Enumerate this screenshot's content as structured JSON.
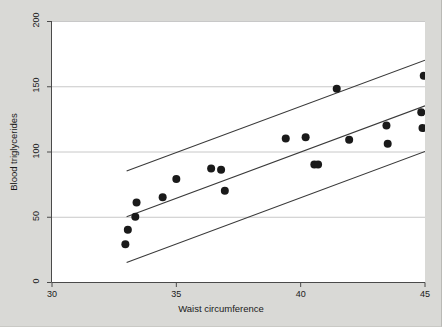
{
  "chart_data": {
    "type": "scatter",
    "title": "",
    "xlabel": "Waist circumference",
    "ylabel": "Blood triglycerides",
    "xlim": [
      30,
      45
    ],
    "ylim": [
      0,
      200
    ],
    "xticks": [
      30,
      35,
      40,
      45
    ],
    "yticks": [
      0,
      50,
      100,
      150,
      200
    ],
    "grid": "horizontal",
    "legend": "none",
    "points": [
      {
        "x": 32.95,
        "y": 29
      },
      {
        "x": 33.05,
        "y": 40
      },
      {
        "x": 33.35,
        "y": 50
      },
      {
        "x": 33.4,
        "y": 61
      },
      {
        "x": 34.45,
        "y": 65
      },
      {
        "x": 35.0,
        "y": 79
      },
      {
        "x": 36.4,
        "y": 87
      },
      {
        "x": 36.8,
        "y": 86
      },
      {
        "x": 36.95,
        "y": 70
      },
      {
        "x": 39.4,
        "y": 110
      },
      {
        "x": 40.2,
        "y": 111
      },
      {
        "x": 40.55,
        "y": 90
      },
      {
        "x": 40.7,
        "y": 90
      },
      {
        "x": 41.45,
        "y": 148
      },
      {
        "x": 41.95,
        "y": 109
      },
      {
        "x": 43.45,
        "y": 120
      },
      {
        "x": 43.5,
        "y": 106
      },
      {
        "x": 44.85,
        "y": 130
      },
      {
        "x": 44.9,
        "y": 118
      },
      {
        "x": 44.95,
        "y": 158
      }
    ],
    "lines": [
      {
        "name": "upper-limit",
        "x": [
          33.0,
          45.0
        ],
        "y": [
          85,
          170
        ]
      },
      {
        "name": "fit",
        "x": [
          33.0,
          45.0
        ],
        "y": [
          50,
          135
        ]
      },
      {
        "name": "lower-limit",
        "x": [
          33.0,
          45.0
        ],
        "y": [
          15,
          100
        ]
      }
    ],
    "marker": {
      "shape": "circle",
      "color": "#1a1a1a",
      "size": 4
    },
    "line_color": "#3a3a3a",
    "grid_color": "#c8c8c8",
    "plot_background": "#ffffff",
    "page_background": "#d9d9d6"
  },
  "axes": {
    "y_tick_labels": [
      "0",
      "50",
      "100",
      "150",
      "200"
    ],
    "x_tick_labels": [
      "30",
      "35",
      "40",
      "45"
    ],
    "y_axis_title": "Blood triglycerides",
    "x_axis_title": "Waist circumference"
  }
}
